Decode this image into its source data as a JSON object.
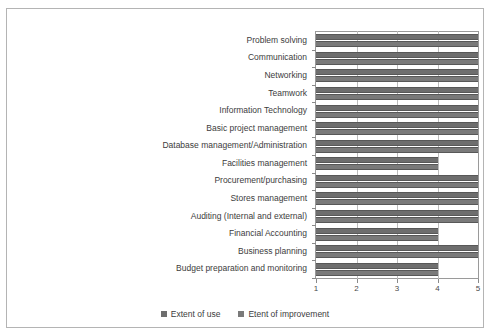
{
  "chart_data": {
    "type": "bar",
    "orientation": "horizontal",
    "title": "",
    "xlabel": "",
    "ylabel": "",
    "xlim": [
      1,
      5
    ],
    "xticks": [
      "1",
      "2",
      "3",
      "4",
      "5"
    ],
    "grid": true,
    "legend_position": "bottom",
    "categories": [
      "Problem solving",
      "Communication",
      "Networking",
      "Teamwork",
      "Information Technology",
      "Basic project management",
      "Database management/Administration",
      "Facilities management",
      "Procurement/purchasing",
      "Stores management",
      "Auditing (Internal and external)",
      "Financial Accounting",
      "Business planning",
      "Budget preparation and monitoring"
    ],
    "series": [
      {
        "name": "Extent of use",
        "color": "#6e6e6e",
        "values": [
          5,
          5,
          5,
          5,
          5,
          5,
          5,
          4,
          5,
          5,
          5,
          4,
          5,
          4
        ]
      },
      {
        "name": "Etent of improvement",
        "color": "#7a7a7a",
        "values": [
          5,
          5,
          5,
          5,
          5,
          5,
          5,
          4,
          5,
          5,
          5,
          4,
          5,
          4
        ]
      }
    ]
  },
  "legend": {
    "items": [
      {
        "label": "Extent of use"
      },
      {
        "label": "Etent of improvement"
      }
    ]
  }
}
